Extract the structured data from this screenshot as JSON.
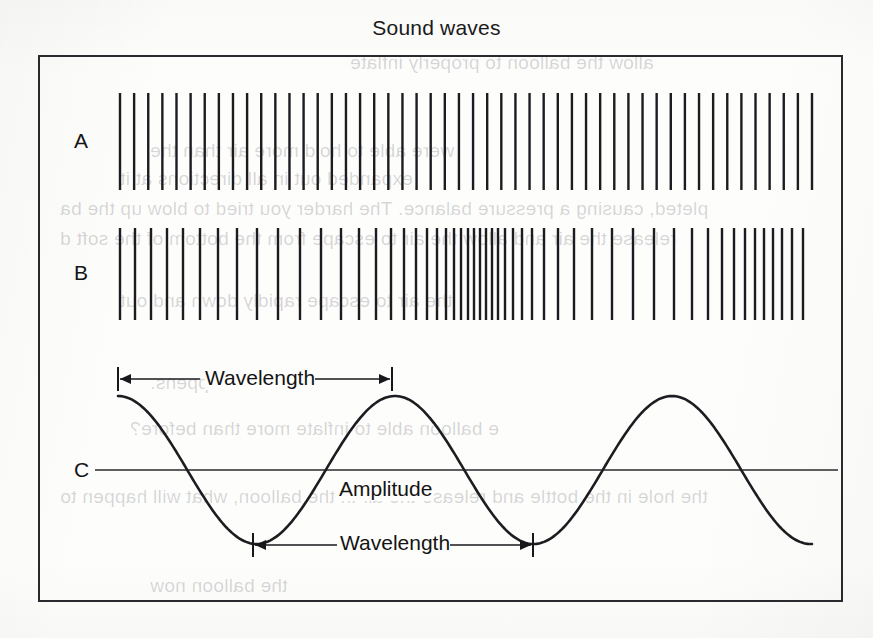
{
  "figure": {
    "title": "Sound waves",
    "row_labels": [
      "A",
      "B",
      "C"
    ],
    "annotations": {
      "wavelength_top": "Wavelength",
      "wavelength_bottom": "Wavelength",
      "amplitude": "Amplitude"
    },
    "colors": {
      "ink": "#1c1c20",
      "frame": "#2a2a2e",
      "paper": "#fdfdfc",
      "ghost": "rgba(40,40,45,0.19)"
    }
  },
  "ghost_text": [
    {
      "text": "allow the balloon to properly inflate",
      "left": 350,
      "top": 52
    },
    {
      "text": "were able to hold more air than the",
      "left": 150,
      "top": 140
    },
    {
      "text": "expanded out in all directions at it",
      "left": 120,
      "top": 168
    },
    {
      "text": "pleted, causing a pressure balance. The harder you tried to blow up the ba",
      "left": 60,
      "top": 198
    },
    {
      "text": "release the air and allow the air to escape from the bottom of the soft d",
      "left": 60,
      "top": 228
    },
    {
      "text": "the air to escape rapidly down and out",
      "left": 120,
      "top": 290
    },
    {
      "text": "at happens.",
      "left": 150,
      "top": 372
    },
    {
      "text": "e balloon able to inflate more than before?",
      "left": 130,
      "top": 418
    },
    {
      "text": "the hole in the bottle and release the air in the balloon, what will happen to",
      "left": 60,
      "top": 486
    },
    {
      "text": "the balloon now",
      "left": 150,
      "top": 575
    }
  ],
  "chart_data": {
    "type": "line",
    "title": "Sound waves",
    "xlabel": "",
    "ylabel": "",
    "xlim": [
      118,
      812
    ],
    "ylim": [
      395,
      545
    ],
    "grid": false,
    "legend": null,
    "panels": [
      {
        "id": "A",
        "label": "A",
        "type": "comb",
        "description": "Uniformly spaced vertical lines representing a constant-frequency sound wave",
        "x_start": 120,
        "x_end": 812,
        "y_top": 93,
        "y_bottom": 190,
        "line_count": 50,
        "spacing_px": 14.1,
        "uniform": true
      },
      {
        "id": "B",
        "label": "B",
        "type": "comb",
        "description": "Variably spaced vertical lines showing compressions and rarefactions",
        "x_start": 120,
        "x_end": 812,
        "y_top": 228,
        "y_bottom": 320,
        "line_count": 52,
        "uniform": false,
        "positions": [
          120,
          135,
          151,
          167,
          183,
          200,
          218,
          237,
          257,
          278,
          300,
          321,
          341,
          359,
          376,
          391,
          404,
          416,
          427,
          437,
          446,
          454,
          461,
          468,
          474,
          480,
          486,
          492,
          498,
          505,
          513,
          522,
          532,
          544,
          558,
          574,
          592,
          612,
          633,
          654,
          674,
          692,
          708,
          722,
          734,
          745,
          755,
          764,
          773,
          782,
          792,
          803
        ]
      },
      {
        "id": "C",
        "label": "C",
        "type": "sine",
        "description": "Transverse sine wave with axis line, amplitude and wavelength annotations",
        "x_start": 118,
        "x_end": 812,
        "axis_y": 470,
        "crest_y": 396,
        "trough_y": 544,
        "amplitude_px": 74,
        "wavelength_px": 277,
        "crests_x": [
          118,
          392,
          672
        ],
        "troughs_x": [
          253,
          533,
          812
        ],
        "wavelength_measure_top": {
          "x1": 118,
          "x2": 392,
          "y": 379
        },
        "wavelength_measure_bottom": {
          "x1": 253,
          "x2": 533,
          "y": 545
        }
      }
    ]
  }
}
